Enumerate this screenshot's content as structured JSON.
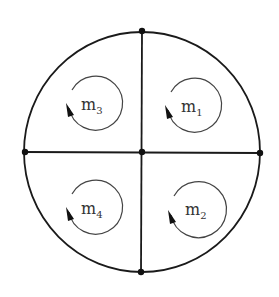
{
  "diagram": {
    "type": "mesh-circuit",
    "outer_circle": {
      "cx": 142,
      "cy": 152,
      "rx": 118,
      "ry": 120
    },
    "nodes": [
      {
        "id": "top",
        "x": 142,
        "y": 31
      },
      {
        "id": "left",
        "x": 25,
        "y": 152
      },
      {
        "id": "center",
        "x": 142,
        "y": 152
      },
      {
        "id": "right",
        "x": 260,
        "y": 153
      },
      {
        "id": "bottom",
        "x": 141,
        "y": 272
      }
    ],
    "meshes": [
      {
        "id": "m1",
        "main": "m",
        "sub": "1",
        "quadrant": "top-right",
        "cx": 195,
        "cy": 106,
        "r": 27,
        "direction": "clockwise"
      },
      {
        "id": "m2",
        "main": "m",
        "sub": "2",
        "quadrant": "bottom-right",
        "cx": 198,
        "cy": 210,
        "r": 28,
        "direction": "clockwise"
      },
      {
        "id": "m3",
        "main": "m",
        "sub": "3",
        "quadrant": "top-left",
        "cx": 96,
        "cy": 104,
        "r": 27,
        "direction": "clockwise"
      },
      {
        "id": "m4",
        "main": "m",
        "sub": "4",
        "quadrant": "bottom-left",
        "cx": 96,
        "cy": 208,
        "r": 27,
        "direction": "clockwise"
      }
    ],
    "colors": {
      "line": "#1a1a1a",
      "loop": "#444444",
      "text": "#333333"
    }
  }
}
